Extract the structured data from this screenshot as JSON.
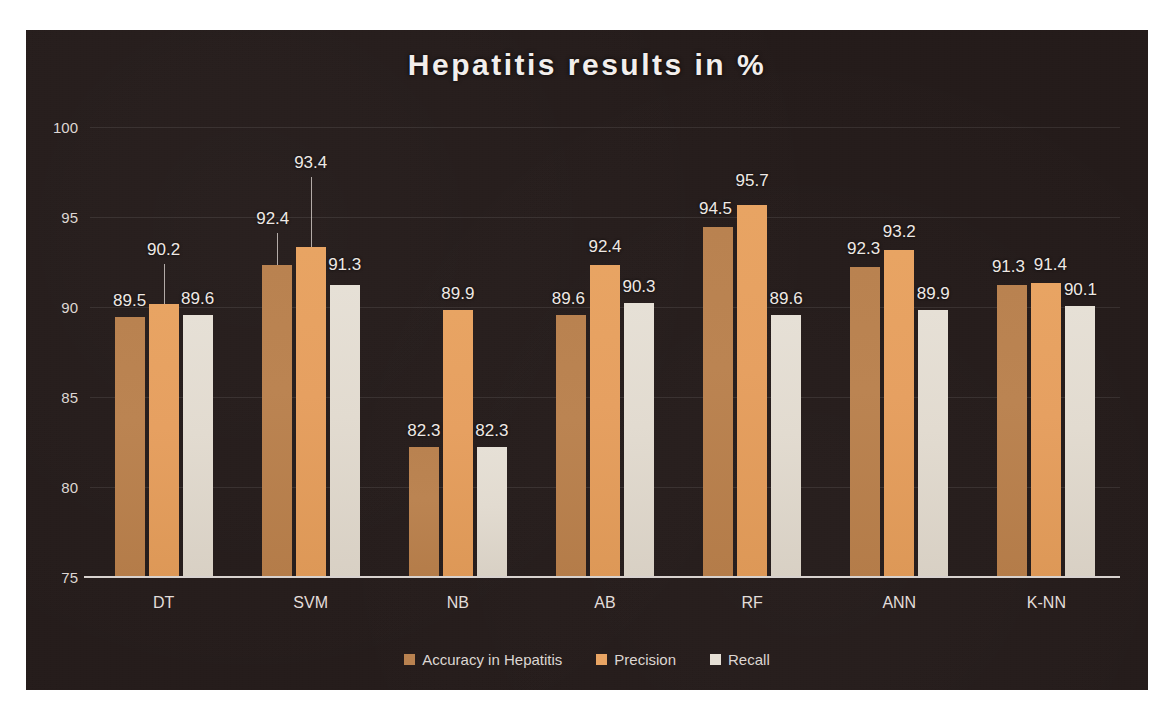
{
  "chart_data": {
    "type": "bar",
    "title": "Hepatitis  results  in %",
    "xlabel": "",
    "ylabel": "",
    "ylim": [
      75,
      100
    ],
    "yticks": [
      75,
      80,
      85,
      90,
      95,
      100
    ],
    "grid": true,
    "legend_position": "bottom",
    "categories": [
      "DT",
      "SVM",
      "NB",
      "AB",
      "RF",
      "ANN",
      "K-NN"
    ],
    "series": [
      {
        "name": "Accuracy in Hepatitis",
        "color": "#b98250",
        "values": [
          89.5,
          92.4,
          82.3,
          89.6,
          94.5,
          92.3,
          91.3
        ]
      },
      {
        "name": "Precision",
        "color": "#e8a463",
        "values": [
          90.2,
          93.4,
          89.9,
          92.4,
          95.7,
          93.2,
          91.4
        ]
      },
      {
        "name": "Recall",
        "color": "#e6e0d6",
        "values": [
          89.6,
          91.3,
          82.3,
          90.3,
          89.6,
          89.9,
          90.1
        ]
      }
    ]
  },
  "panel": {
    "background_color": "#241b1a",
    "text_color": "#efe9e5"
  }
}
